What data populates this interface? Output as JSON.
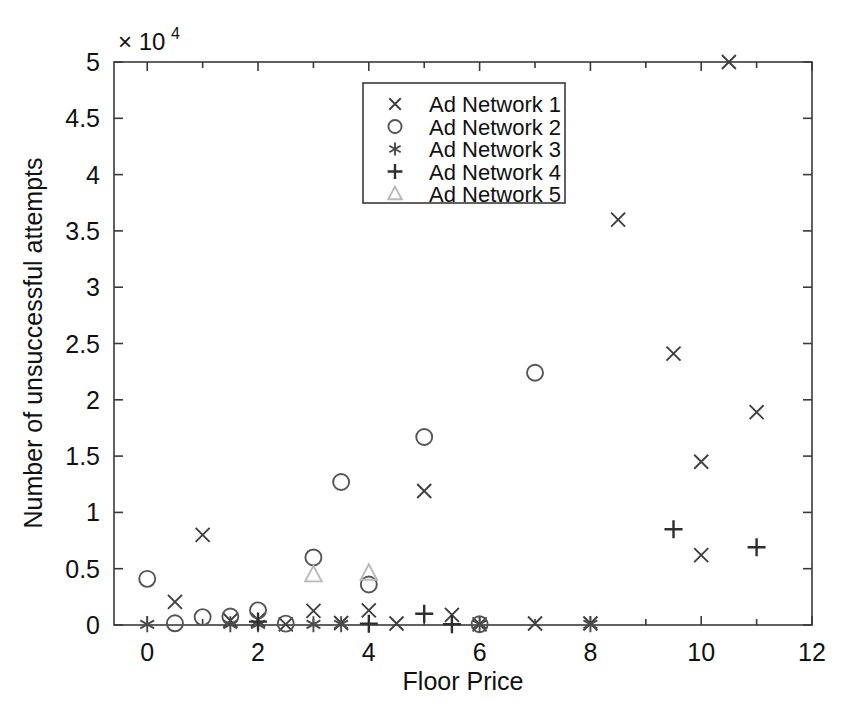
{
  "chart_data": {
    "type": "scatter",
    "title": "",
    "xlabel": "Floor Price",
    "ylabel": "Number of unsuccessful attempts",
    "y_exponent_label": "× 10",
    "y_exponent_power": "4",
    "y_multiplier": 10000,
    "xlim": [
      -0.6,
      12
    ],
    "ylim": [
      0,
      50000
    ],
    "xticks": [
      0,
      2,
      4,
      6,
      8,
      10,
      12
    ],
    "xticklabels": [
      "0",
      "2",
      "4",
      "6",
      "8",
      "10",
      "12"
    ],
    "x_minor_ticks": [
      1,
      3,
      5,
      7,
      9,
      11
    ],
    "yticks": [
      0,
      5000,
      10000,
      15000,
      20000,
      25000,
      30000,
      35000,
      40000,
      45000,
      50000
    ],
    "yticklabels": [
      "0",
      "0.5",
      "1",
      "1.5",
      "2",
      "2.5",
      "3",
      "3.5",
      "4",
      "4.5",
      "5"
    ],
    "grid": false,
    "legend_position": "upper center",
    "series": [
      {
        "name": "Ad Network 1",
        "marker": "x",
        "color": "#3f3f3f",
        "points": [
          [
            0.5,
            2050
          ],
          [
            1.0,
            8000
          ],
          [
            1.5,
            400
          ],
          [
            2.0,
            450
          ],
          [
            2.5,
            60
          ],
          [
            3.0,
            1250
          ],
          [
            3.5,
            180
          ],
          [
            4.0,
            1300
          ],
          [
            4.5,
            130
          ],
          [
            5.0,
            11900
          ],
          [
            5.5,
            900
          ],
          [
            6.0,
            60
          ],
          [
            7.0,
            130
          ],
          [
            8.0,
            130
          ],
          [
            8.5,
            36000
          ],
          [
            9.5,
            24100
          ],
          [
            10.0,
            14500
          ],
          [
            10.5,
            50000
          ],
          [
            10.0,
            6200
          ],
          [
            11.0,
            18900
          ]
        ]
      },
      {
        "name": "Ad Network 2",
        "marker": "o",
        "color": "#555555",
        "points": [
          [
            0.0,
            4100
          ],
          [
            0.5,
            150
          ],
          [
            1.0,
            700
          ],
          [
            1.5,
            750
          ],
          [
            2.0,
            1300
          ],
          [
            2.5,
            120
          ],
          [
            3.0,
            6000
          ],
          [
            3.5,
            12700
          ],
          [
            4.0,
            3600
          ],
          [
            5.0,
            16700
          ],
          [
            6.0,
            70
          ],
          [
            7.0,
            22400
          ]
        ]
      },
      {
        "name": "Ad Network 3",
        "marker": "*",
        "color": "#4a4a4a",
        "points": [
          [
            0.0,
            60
          ],
          [
            1.5,
            60
          ],
          [
            2.0,
            60
          ],
          [
            3.0,
            60
          ],
          [
            3.5,
            60
          ],
          [
            6.0,
            60
          ],
          [
            8.0,
            60
          ]
        ]
      },
      {
        "name": "Ad Network 4",
        "marker": "+",
        "color": "#2e2e2e",
        "points": [
          [
            2.0,
            300
          ],
          [
            4.0,
            120
          ],
          [
            5.0,
            1000
          ],
          [
            5.5,
            60
          ],
          [
            9.5,
            8500
          ],
          [
            11.0,
            6900
          ]
        ]
      },
      {
        "name": "Ad Network 5",
        "marker": "^",
        "color": "#b9b9b9",
        "points": [
          [
            3.0,
            4450
          ],
          [
            4.0,
            4600
          ]
        ]
      }
    ],
    "legend_entries": [
      {
        "label": "Ad Network 1",
        "marker": "x"
      },
      {
        "label": "Ad Network 2",
        "marker": "o"
      },
      {
        "label": "Ad Network 3",
        "marker": "*"
      },
      {
        "label": "Ad Network 4",
        "marker": "+"
      },
      {
        "label": "Ad Network 5",
        "marker": "^"
      }
    ]
  }
}
